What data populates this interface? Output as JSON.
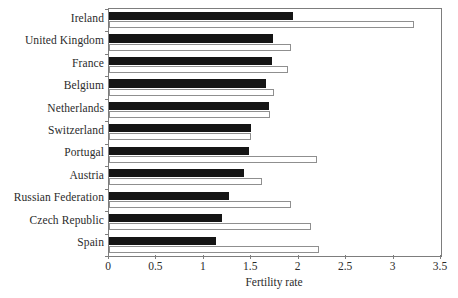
{
  "chart_data": {
    "type": "bar",
    "orientation": "horizontal",
    "title": "",
    "xlabel": "Fertility rate",
    "ylabel": "",
    "xlim": [
      0,
      3.5
    ],
    "xticks": [
      "0",
      "0.5",
      "1",
      "1.5",
      "2",
      "2.5",
      "3",
      "3.5"
    ],
    "xtick_values": [
      0,
      0.5,
      1,
      1.5,
      2,
      2.5,
      3,
      3.5
    ],
    "grid": false,
    "legend": "none",
    "categories": [
      "Ireland",
      "United Kingdom",
      "France",
      "Belgium",
      "Netherlands",
      "Switzerland",
      "Portugal",
      "Austria",
      "Russian Federation",
      "Czech Republic",
      "Spain"
    ],
    "series": [
      {
        "name": "dark-series",
        "color": "#151515",
        "style": "filled-black",
        "values": [
          1.94,
          1.73,
          1.72,
          1.66,
          1.69,
          1.5,
          1.48,
          1.42,
          1.26,
          1.19,
          1.13
        ]
      },
      {
        "name": "light-series",
        "color": "#ffffff",
        "style": "open-outlined",
        "values": [
          3.22,
          1.92,
          1.89,
          1.74,
          1.7,
          1.5,
          2.19,
          1.61,
          1.92,
          2.13,
          2.21
        ]
      }
    ]
  }
}
